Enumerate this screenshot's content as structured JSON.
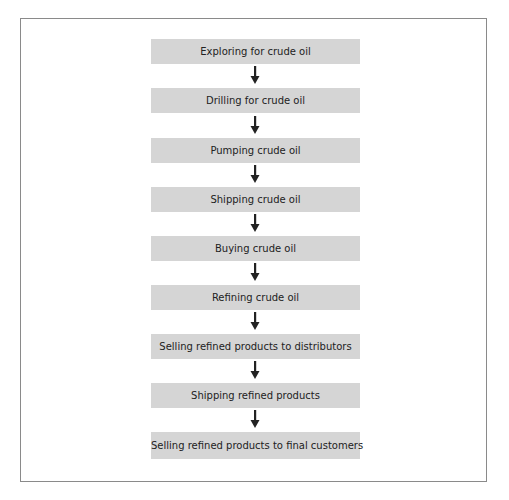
{
  "diagram": {
    "type": "flowchart",
    "direction": "top-to-bottom",
    "steps": [
      {
        "label": "Exploring for crude oil"
      },
      {
        "label": "Drilling for crude oil"
      },
      {
        "label": "Pumping crude oil"
      },
      {
        "label": "Shipping crude oil"
      },
      {
        "label": "Buying crude oil"
      },
      {
        "label": "Refining crude oil"
      },
      {
        "label": "Selling refined products to distributors"
      },
      {
        "label": "Shipping refined products"
      },
      {
        "label": "Selling refined products to final customers"
      }
    ],
    "colors": {
      "box_fill": "#d5d5d5",
      "frame_border": "#8a8a8a",
      "arrow": "#222222",
      "text": "#222222"
    }
  }
}
